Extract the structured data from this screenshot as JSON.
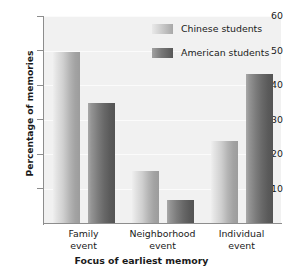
{
  "chart_data": {
    "type": "bar",
    "title": "",
    "subtitle": "",
    "xlabel": "Focus of earliest memory",
    "ylabel": "Percentage of memories",
    "categories": [
      "Family event",
      "Neighborhood event",
      "Individual event"
    ],
    "category_lines": [
      [
        "Family",
        "event"
      ],
      [
        "Neighborhood",
        "event"
      ],
      [
        "Individual",
        "event"
      ]
    ],
    "series": [
      {
        "name": "Chinese students",
        "color": "#c4c4c4",
        "values": [
          49.5,
          15.0,
          23.8
        ]
      },
      {
        "name": "American students",
        "color": "#6b6b6b",
        "values": [
          34.8,
          6.6,
          43.2
        ]
      }
    ],
    "ylim": [
      0,
      60
    ],
    "yticks": [
      10,
      20,
      30,
      40,
      50,
      60
    ],
    "ytick_labels": [
      "10",
      "20",
      "30",
      "40",
      "50",
      "60"
    ],
    "grid": true,
    "grid_axis": "y",
    "legend_position": "top-right",
    "plot_background": "#f1f1f1",
    "axis_color": "#8d8d8d"
  },
  "legend": {
    "entries": [
      {
        "label": "Chinese students",
        "swatch": "light"
      },
      {
        "label": "American students",
        "swatch": "dark"
      }
    ]
  },
  "axes": {
    "y_title": "Percentage of memories",
    "x_title": "Focus of earliest memory"
  }
}
